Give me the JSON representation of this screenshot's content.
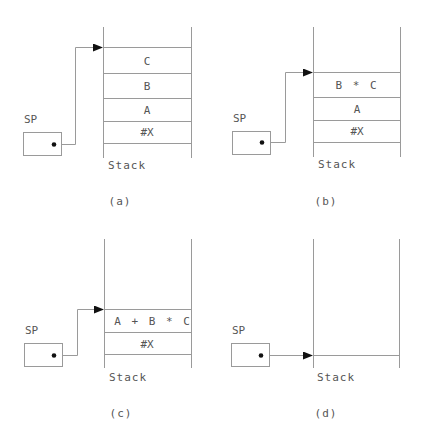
{
  "figure": {
    "line_color": "#9a9a9a",
    "arrow_color": "#111111",
    "pointer_label": "SP",
    "stack_label": "Stack",
    "panels": [
      {
        "id": "a",
        "caption": "(a)",
        "cells": [
          "C",
          "B",
          "A",
          "#X"
        ]
      },
      {
        "id": "b",
        "caption": "(b)",
        "cells": [
          "B * C",
          "A",
          "#X"
        ]
      },
      {
        "id": "c",
        "caption": "(c)",
        "cells": [
          "A + B * C",
          "#X"
        ]
      },
      {
        "id": "d",
        "caption": "(d)",
        "cells": []
      }
    ]
  }
}
